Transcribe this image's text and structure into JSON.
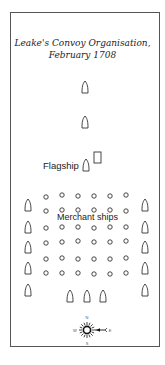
{
  "title": {
    "line1": "Leake's Convoy Organisation,",
    "line2": "February 1708"
  },
  "labels": {
    "flagship": "Flagship",
    "merchant_ships": "Merchant ships"
  },
  "compass": {
    "north": "N",
    "south": "S",
    "west": "W",
    "east": "E",
    "wind_direction": "from east"
  },
  "formation": {
    "lead_escorts": 2,
    "flagship_count": 1,
    "merchant_rows": 6,
    "merchant_columns": 6,
    "flank_escorts_per_side": 5,
    "rear_escorts": 3
  },
  "colors": {
    "ink": "#333333",
    "background": "#ffffff"
  }
}
